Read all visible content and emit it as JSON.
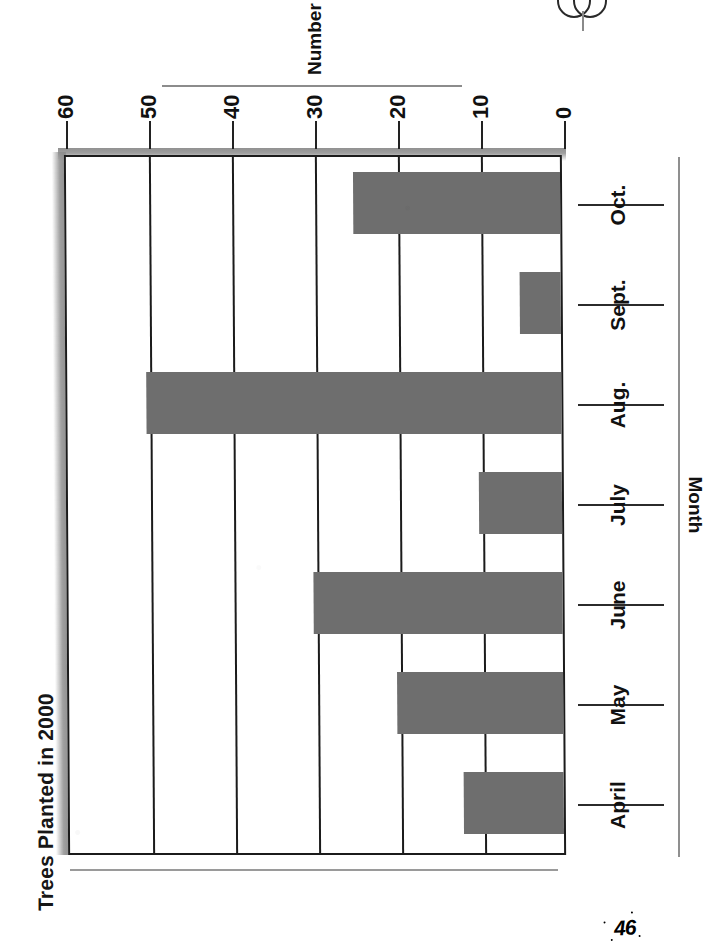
{
  "page": {
    "number": "46",
    "binding_mark_icon": "spiral-binding-icon"
  },
  "chart_data": {
    "type": "bar",
    "title": "Trees Planted in 2000",
    "orientation": "vertical-bars-page-rotated-90",
    "categories": [
      "April",
      "May",
      "June",
      "July",
      "Aug.",
      "Sept.",
      "Oct."
    ],
    "values": [
      12,
      20,
      30,
      10,
      50,
      5,
      25
    ],
    "xlabel": "Month",
    "ylabel": "Number Planted",
    "ylim": [
      0,
      60
    ],
    "ytick_labels": [
      "0",
      "10",
      "20",
      "30",
      "40",
      "50",
      "60"
    ],
    "ytick_values": [
      0,
      10,
      20,
      30,
      40,
      50,
      60
    ],
    "grid": "horizontal-gridlines-at-each-ytick",
    "legend": "none",
    "bar_color": "#6e6e6e",
    "axis_color": "#1b1b1b",
    "background": "#ffffff"
  }
}
